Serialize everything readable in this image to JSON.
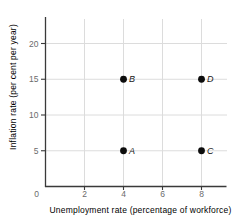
{
  "figure": {
    "background": "#ffffff"
  },
  "chart_data": {
    "type": "scatter",
    "title": "",
    "xlabel": "Unemployment rate (percentage of workforce)",
    "ylabel": "Inflation rate (per cent per year)",
    "xticks": [
      0,
      2,
      4,
      6,
      8
    ],
    "yticks": [
      0,
      5,
      10,
      15,
      20
    ],
    "xlim": [
      0,
      9.3
    ],
    "ylim": [
      0,
      23.5
    ],
    "grid": true,
    "legend": "none",
    "origin_label": "0",
    "points": [
      {
        "label": "A",
        "x": 4,
        "y": 5
      },
      {
        "label": "B",
        "x": 4,
        "y": 15
      },
      {
        "label": "C",
        "x": 8,
        "y": 5
      },
      {
        "label": "D",
        "x": 8,
        "y": 15
      }
    ],
    "colors": {
      "axis": "#3a3a3a",
      "grid": "#dcdcdc",
      "tick_text": "#6b6b6b",
      "axis_title_text": "#6b6b6b",
      "point": "#0d0d0d",
      "point_label": "#1a1a1a"
    }
  }
}
